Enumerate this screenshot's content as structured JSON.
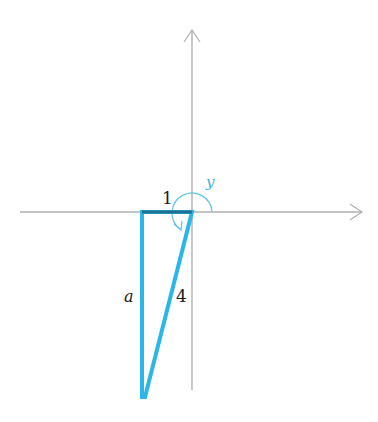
{
  "diagram": {
    "type": "coordinate-plane-triangle",
    "colors": {
      "axis": "#b0b0b0",
      "triangle": "#29b6e8",
      "arc": "#5fc3ea",
      "label": "#1a1a1a",
      "angle_label": "#3bb4e6"
    },
    "labels": {
      "horizontal_leg": "1",
      "vertical_leg": "a",
      "hypotenuse": "4",
      "angle": "y"
    }
  }
}
